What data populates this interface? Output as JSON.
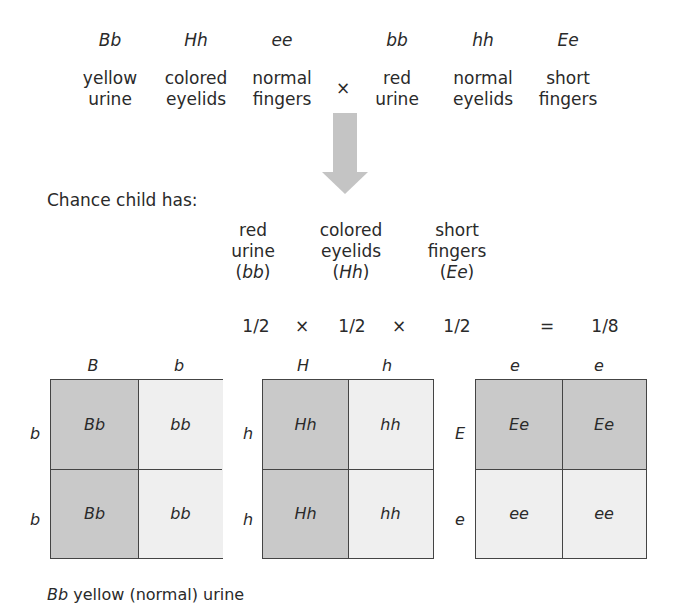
{
  "parents": {
    "parent1": {
      "genotypes": [
        "Bb",
        "Hh",
        "ee"
      ],
      "phenotypes": [
        {
          "line1": "yellow",
          "line2": "urine"
        },
        {
          "line1": "colored",
          "line2": "eyelids"
        },
        {
          "line1": "normal",
          "line2": "fingers"
        }
      ]
    },
    "cross_symbol": "×",
    "parent2": {
      "genotypes": [
        "bb",
        "hh",
        "Ee"
      ],
      "phenotypes": [
        {
          "line1": "red",
          "line2": "urine"
        },
        {
          "line1": "normal",
          "line2": "eyelids"
        },
        {
          "line1": "short",
          "line2": "fingers"
        }
      ]
    }
  },
  "arrow": {
    "icon": "down-arrow-icon",
    "color": "#c4c4c4"
  },
  "chance_label": "Chance child has:",
  "traits": [
    {
      "line1": "red",
      "line2": "urine",
      "genotype": "bb"
    },
    {
      "line1": "colored",
      "line2": "eyelids",
      "genotype": "Hh"
    },
    {
      "line1": "short",
      "line2": "fingers",
      "genotype": "Ee"
    }
  ],
  "probability": {
    "factors": [
      "1/2",
      "1/2",
      "1/2"
    ],
    "times": "×",
    "equals": "=",
    "result": "1/8"
  },
  "punnett_squares": [
    {
      "cols": [
        "B",
        "b"
      ],
      "rows": [
        "b",
        "b"
      ],
      "cells": [
        [
          "Bb",
          "bb"
        ],
        [
          "Bb",
          "bb"
        ]
      ],
      "shade": [
        [
          "dark",
          "light"
        ],
        [
          "dark",
          "light"
        ]
      ]
    },
    {
      "cols": [
        "H",
        "h"
      ],
      "rows": [
        "h",
        "h"
      ],
      "cells": [
        [
          "Hh",
          "hh"
        ],
        [
          "Hh",
          "hh"
        ]
      ],
      "shade": [
        [
          "dark",
          "light"
        ],
        [
          "dark",
          "light"
        ]
      ]
    },
    {
      "cols": [
        "e",
        "e"
      ],
      "rows": [
        "E",
        "e"
      ],
      "cells": [
        [
          "Ee",
          "Ee"
        ],
        [
          "ee",
          "ee"
        ]
      ],
      "shade": [
        [
          "dark",
          "dark"
        ],
        [
          "light",
          "light"
        ]
      ]
    }
  ],
  "colors": {
    "dark_cell": "#c9c9c9",
    "light_cell": "#efefef",
    "grid_line": "#444444"
  },
  "caption": {
    "genotype": "Bb",
    "text": " yellow (normal) urine"
  }
}
